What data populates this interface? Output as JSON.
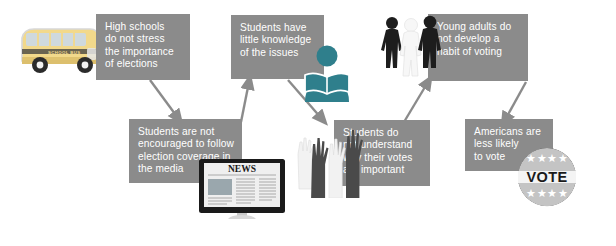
{
  "diagram": {
    "box_fill": "#8b8b8b",
    "box_text_color": "#ffffff",
    "arrow_color": "#8b8b8b",
    "background": "#ffffff",
    "boxes": [
      {
        "id": "high-schools",
        "text": "High schools\ndo not stress\nthe importance\nof elections"
      },
      {
        "id": "little-knowledge",
        "text": "Students have\nlittle knowledge\nof the issues"
      },
      {
        "id": "young-adults",
        "text": "Young adults do\nnot develop a\nhabit of voting"
      },
      {
        "id": "not-encouraged",
        "text": "Students are not\nencouraged to follow\nelection coverage in\nthe media"
      },
      {
        "id": "do-not-understand",
        "text": "Students do\nnot understand\nwhy their votes\nare important"
      },
      {
        "id": "less-likely",
        "text": "Americans are\nless likely\nto vote"
      }
    ],
    "illustrations": {
      "school_bus_label": "SCHOOL BUS",
      "news_monitor_label": "NEWS",
      "vote_badge_label": "VOTE",
      "vote_badge_stars": "★★★★"
    }
  }
}
